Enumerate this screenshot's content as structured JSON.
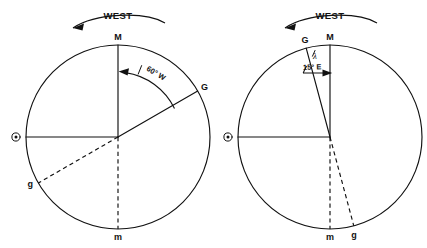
{
  "figure": {
    "background_color": "#ffffff",
    "ink_color": "#111111",
    "width": 427,
    "height": 248
  },
  "diagrams": [
    {
      "id": "left-diagram",
      "name": "west-longitude-diagram",
      "rotation_label": "WEST",
      "rotation_direction": "counterclockwise-westward",
      "circle": {
        "cx": 118,
        "cy": 137,
        "r": 92
      },
      "angle_label": "60° W",
      "angle_symbol": "λ",
      "angle_degrees": 60,
      "angle_hemisphere": "W",
      "points": [
        {
          "label": "M",
          "name": "meridian-upper-m",
          "x": 118,
          "y": 45,
          "anchor": "middle",
          "dy": -5
        },
        {
          "label": "G",
          "name": "greenwich-upper-g",
          "x": 198,
          "y": 92,
          "anchor": "start",
          "dy": -2
        },
        {
          "label": "m",
          "name": "meridian-lower-m",
          "x": 118,
          "y": 229,
          "anchor": "middle",
          "dy": 11
        },
        {
          "label": "g",
          "name": "greenwich-lower-g",
          "x": 38,
          "y": 183,
          "anchor": "end",
          "dy": 2
        }
      ],
      "sun_symbol": {
        "name": "sun-symbol",
        "glyph": "⊙",
        "x": 16,
        "y": 137
      }
    },
    {
      "id": "right-diagram",
      "name": "east-longitude-diagram",
      "rotation_label": "WEST",
      "rotation_direction": "counterclockwise-westward",
      "circle": {
        "cx": 330,
        "cy": 137,
        "r": 92
      },
      "angle_label": "15° E",
      "angle_symbol": "λ",
      "angle_degrees": 15,
      "angle_hemisphere": "E",
      "points": [
        {
          "label": "G",
          "name": "greenwich-upper-g",
          "x": 306,
          "y": 48,
          "anchor": "middle",
          "dy": -5
        },
        {
          "label": "M",
          "name": "meridian-upper-m",
          "x": 330,
          "y": 45,
          "anchor": "middle",
          "dy": -5
        },
        {
          "label": "m",
          "name": "meridian-lower-m",
          "x": 330,
          "y": 229,
          "anchor": "middle",
          "dy": 11
        },
        {
          "label": "g",
          "name": "greenwich-lower-g",
          "x": 354,
          "y": 226,
          "anchor": "middle",
          "dy": 11
        }
      ],
      "sun_symbol": {
        "name": "sun-symbol",
        "glyph": "⊙",
        "x": 228,
        "y": 137
      }
    }
  ]
}
